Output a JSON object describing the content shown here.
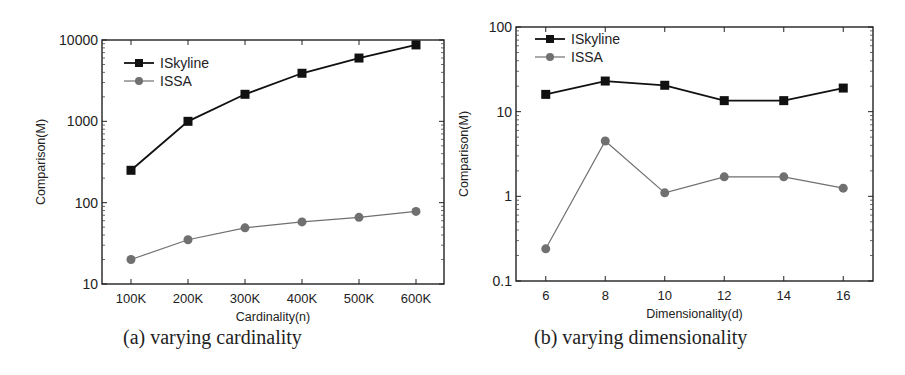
{
  "chart_data": [
    {
      "id": "a",
      "type": "line",
      "caption": "(a) varying cardinality",
      "xlabel": "Cardinality(n)",
      "ylabel": "Comparison(M)",
      "yscale": "log",
      "ylim": [
        10,
        10000
      ],
      "yticks": [
        10,
        100,
        1000,
        10000
      ],
      "ytick_labels": [
        "10",
        "100",
        "1000",
        "10000"
      ],
      "categories": [
        "100K",
        "200K",
        "300K",
        "400K",
        "500K",
        "600K"
      ],
      "grid": false,
      "legend_position": "upper left",
      "series": [
        {
          "name": "ISkyline",
          "marker": "square",
          "color": "#111111",
          "values": [
            250,
            1000,
            2150,
            3900,
            6000,
            8700
          ]
        },
        {
          "name": "ISSA",
          "marker": "circle",
          "color": "#707070",
          "values": [
            20,
            35,
            49,
            58,
            66,
            78
          ]
        }
      ]
    },
    {
      "id": "b",
      "type": "line",
      "caption": "(b) varying dimensionality",
      "xlabel": "Dimensionality(d)",
      "ylabel": "Comparison(M)",
      "yscale": "log",
      "ylim": [
        0.1,
        100
      ],
      "yticks": [
        0.1,
        1,
        10,
        100
      ],
      "ytick_labels": [
        "0.1",
        "1",
        "10",
        "100"
      ],
      "x": [
        6,
        8,
        10,
        12,
        14,
        16
      ],
      "categories": [
        "6",
        "8",
        "10",
        "12",
        "14",
        "16"
      ],
      "xlim": [
        5,
        17
      ],
      "grid": false,
      "legend_position": "upper left",
      "series": [
        {
          "name": "ISkyline",
          "marker": "square",
          "color": "#111111",
          "values": [
            16,
            23,
            20.5,
            13.5,
            13.5,
            19
          ]
        },
        {
          "name": "ISSA",
          "marker": "circle",
          "color": "#707070",
          "values": [
            0.24,
            4.5,
            1.1,
            1.7,
            1.7,
            1.25
          ]
        }
      ]
    }
  ]
}
